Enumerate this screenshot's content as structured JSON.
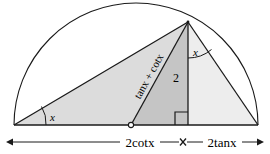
{
  "figure": {
    "labels": {
      "angle_left": "x",
      "angle_apex": "x",
      "altitude": "2",
      "hypotenuse_segment": "tanx + cotx",
      "base_left": "2cotx",
      "base_right": "2tanx"
    },
    "label_parts": {
      "tan_word": "tan",
      "cot_word": "cot",
      "plus_sign": "+",
      "var": "x",
      "two": "2"
    },
    "dimension_ticks": {
      "left_arrow": "←",
      "right_arrow": "→",
      "divider": "×"
    },
    "colors": {
      "stroke": "#1a1a1a",
      "fill_large_triangle": "#dcdcdc",
      "fill_middle_wedge": "#c8c8c8",
      "fill_right_triangle": "#ececec",
      "background": "#ffffff"
    },
    "geometry": {
      "base_left_x": 14,
      "base_right_x": 258,
      "baseline_y": 125,
      "apex_x": 188,
      "apex_y": 22,
      "foot_x": 188,
      "foot_y": 125,
      "mid_point_x": 131,
      "mid_point_y": 125,
      "semicircle_center_x": 136,
      "semicircle_radius": 122
    }
  }
}
